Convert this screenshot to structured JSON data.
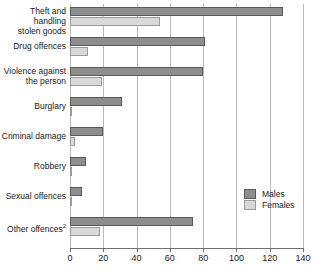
{
  "chart_data": {
    "type": "bar",
    "orientation": "horizontal",
    "title": "",
    "xlabel": "",
    "ylabel": "",
    "xlim": [
      0,
      140
    ],
    "xticks": [
      0,
      20,
      40,
      60,
      80,
      100,
      120,
      140
    ],
    "grid": true,
    "legend_position": "inside-right",
    "categories": [
      "Theft and handling stolen goods",
      "Drug offences",
      "Violence against the person",
      "Burglary",
      "Criminal damage",
      "Robbery",
      "Sexual offences",
      "Other offences"
    ],
    "series": [
      {
        "name": "Males",
        "color": "#8d8d8d",
        "values": [
          128,
          81,
          80,
          31,
          20,
          9.5,
          7,
          74
        ]
      },
      {
        "name": "Females",
        "color": "#d9d9d9",
        "values": [
          54,
          11,
          19,
          1.5,
          3,
          1,
          0.3,
          18
        ]
      }
    ]
  },
  "axis": {
    "tick_labels": [
      "0",
      "20",
      "40",
      "60",
      "80",
      "100",
      "120",
      "140"
    ]
  },
  "categories_display": [
    {
      "line1": "Theft and handling",
      "line2": "stolen goods",
      "sup": ""
    },
    {
      "line1": "Drug offences",
      "line2": "",
      "sup": ""
    },
    {
      "line1": "Violence against",
      "line2": "the person",
      "sup": ""
    },
    {
      "line1": "Burglary",
      "line2": "",
      "sup": ""
    },
    {
      "line1": "Criminal damage",
      "line2": "",
      "sup": ""
    },
    {
      "line1": "Robbery",
      "line2": "",
      "sup": ""
    },
    {
      "line1": "Sexual offences",
      "line2": "",
      "sup": ""
    },
    {
      "line1": "Other offences",
      "line2": "",
      "sup": "2"
    }
  ],
  "legend": {
    "males_label": "Males",
    "females_label": "Females"
  }
}
